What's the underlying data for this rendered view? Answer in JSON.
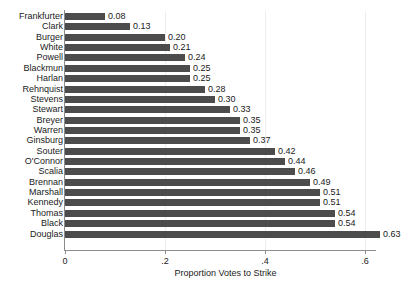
{
  "chart_data": {
    "type": "bar",
    "orientation": "horizontal",
    "title": "",
    "xlabel": "Proportion Votes to Strike",
    "ylabel": "",
    "xlim": [
      0,
      0.66
    ],
    "xticks": [
      0,
      0.2,
      0.4,
      0.6
    ],
    "xtick_labels": [
      "0",
      ".2",
      ".4",
      ".6"
    ],
    "grid": "vertical",
    "legend": "none",
    "bar_color": "#4c4c4c",
    "categories": [
      "Frankfurter",
      "Clark",
      "Burger",
      "White",
      "Powell",
      "Blackmun",
      "Harlan",
      "Rehnquist",
      "Stevens",
      "Stewart",
      "Breyer",
      "Warren",
      "Ginsburg",
      "Souter",
      "O'Connor",
      "Scalia",
      "Brennan",
      "Marshall",
      "Kennedy",
      "Thomas",
      "Black",
      "Douglas"
    ],
    "values": [
      0.08,
      0.13,
      0.2,
      0.21,
      0.24,
      0.25,
      0.25,
      0.28,
      0.3,
      0.33,
      0.35,
      0.35,
      0.37,
      0.42,
      0.44,
      0.46,
      0.49,
      0.51,
      0.51,
      0.54,
      0.54,
      0.63
    ],
    "value_labels": [
      "0.08",
      "0.13",
      "0.20",
      "0.21",
      "0.24",
      "0.25",
      "0.25",
      "0.28",
      "0.30",
      "0.33",
      "0.35",
      "0.35",
      "0.37",
      "0.42",
      "0.44",
      "0.46",
      "0.49",
      "0.51",
      "0.51",
      "0.54",
      "0.54",
      "0.63"
    ]
  }
}
